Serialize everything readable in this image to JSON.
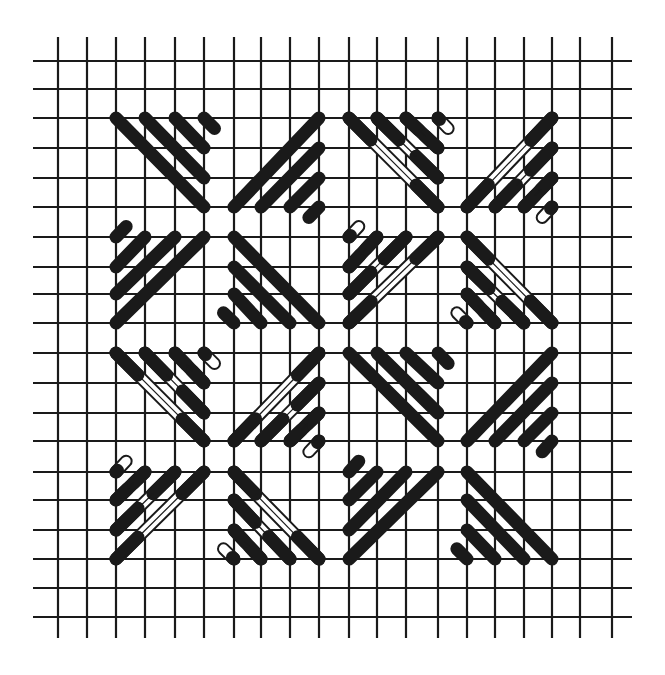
{
  "diagram": {
    "canvas": {
      "width": 665,
      "height": 675,
      "background": "#ffffff"
    },
    "colors": {
      "ink": "#1a1a1a",
      "paper": "#ffffff"
    },
    "grid": {
      "vertical_lines_x": [
        58,
        87,
        116,
        145,
        175,
        204,
        234,
        261,
        290,
        319,
        349,
        377,
        406,
        438,
        467,
        495,
        524,
        552,
        580,
        612
      ],
      "horizontal_lines_y": [
        61,
        89,
        118,
        148,
        178,
        207,
        237,
        267,
        294,
        323,
        353,
        383,
        413,
        441,
        472,
        500,
        530,
        559,
        588,
        617
      ],
      "vertical_extent": [
        37,
        638
      ],
      "horizontal_extent": [
        33,
        632
      ],
      "line_width": 2.2
    },
    "stitch": {
      "solid_width": 13,
      "hollow_outline_width": 2,
      "hollow_end_fill_cells": 1.0
    },
    "fan_template": [
      {
        "from": [
          -3.5,
          -3.5
        ],
        "to": [
          -0.5,
          -0.5
        ]
      },
      {
        "from": [
          -2.5,
          -3.5
        ],
        "to": [
          -0.5,
          -1.5
        ]
      },
      {
        "from": [
          -1.5,
          -3.5
        ],
        "to": [
          -0.5,
          -2.5
        ]
      },
      {
        "from": [
          -0.5,
          -3.5
        ],
        "to": [
          -0.15,
          -3.15
        ],
        "stub": true
      }
    ],
    "fans": [
      "top-left",
      "top-right",
      "bottom-right",
      "bottom-left"
    ],
    "blocks": [
      {
        "name": "block-top-left",
        "center": [
          5.5,
          5.5
        ],
        "style": "solid"
      },
      {
        "name": "block-top-right",
        "center": [
          13.5,
          5.5
        ],
        "style": "hollow"
      },
      {
        "name": "block-bottom-left",
        "center": [
          5.5,
          13.5
        ],
        "style": "hollow"
      },
      {
        "name": "block-bottom-right",
        "center": [
          13.5,
          13.5
        ],
        "style": "solid"
      }
    ]
  }
}
